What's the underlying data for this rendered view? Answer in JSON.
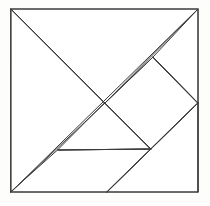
{
  "figure": {
    "shape": "square",
    "piece_count": 7,
    "stroke_color": "#3a3a3a",
    "fill_color": "#ffffff",
    "background_color": "#fdfdfc",
    "canvas": {
      "width": 210,
      "height": 206
    }
  },
  "square_bounds": {
    "left": 11,
    "top": 9,
    "right": 198,
    "bottom": 192,
    "width": 187,
    "height": 183
  },
  "vertices": {
    "top_left": {
      "x": 11,
      "y": 9
    },
    "top_right": {
      "x": 198,
      "y": 9
    },
    "bottom_right": {
      "x": 198,
      "y": 192
    },
    "bottom_left": {
      "x": 11,
      "y": 192
    },
    "center": {
      "x": 105,
      "y": 103
    },
    "right_mid": {
      "x": 198,
      "y": 103
    },
    "bottom_mid": {
      "x": 107,
      "y": 192
    },
    "diamond_top": {
      "x": 153,
      "y": 57
    },
    "diamond_bottom": {
      "x": 151,
      "y": 149
    },
    "para_left": {
      "x": 58,
      "y": 150
    }
  },
  "outer_frame": {
    "name": "square-border",
    "points": "11,9 198,9 198,192 11,192"
  },
  "pieces": [
    {
      "id": "large-triangle-upper-left",
      "label": "Large triangle (upper left)",
      "type": "large-triangle",
      "points": "11,9 198,9 105,103"
    },
    {
      "id": "large-triangle-lower-left",
      "label": "Large triangle (lower left)",
      "type": "large-triangle",
      "points": "11,9 105,103 11,192"
    },
    {
      "id": "medium-triangle-right",
      "label": "Medium triangle (right)",
      "type": "medium-triangle",
      "points": "198,103 198,192 107,192"
    },
    {
      "id": "small-triangle-top-right",
      "label": "Small triangle (top right)",
      "type": "small-triangle",
      "points": "153,57 198,9 198,103"
    },
    {
      "id": "small-triangle-center-bottom",
      "label": "Small triangle (center bottom)",
      "type": "small-triangle",
      "points": "105,103 151,149 58,150"
    },
    {
      "id": "square-center",
      "label": "Square (rotated 45 degrees)",
      "type": "square",
      "points": "105,103 153,57 198,103 151,149"
    },
    {
      "id": "parallelogram-bottom-left",
      "label": "Parallelogram (bottom left)",
      "type": "parallelogram",
      "points": "58,150 151,149 107,192 11,192"
    }
  ],
  "cut_lines": [
    {
      "id": "cut-main-diagonal-tl-br",
      "label": "Diagonal: top-left to center",
      "x1": 11,
      "y1": 9,
      "x2": 105,
      "y2": 103
    },
    {
      "id": "cut-anti-diagonal",
      "label": "Diagonal: bottom-left to top-right",
      "x1": 11,
      "y1": 192,
      "x2": 198,
      "y2": 9
    },
    {
      "id": "cut-center-to-diamond-top",
      "label": "Diamond edge: center to top vertex",
      "x1": 105,
      "y1": 103,
      "x2": 153,
      "y2": 57
    },
    {
      "id": "cut-diamond-top-right",
      "label": "Diamond edge: top vertex to right",
      "x1": 153,
      "y1": 57,
      "x2": 198,
      "y2": 103
    },
    {
      "id": "cut-diamond-right-bottom",
      "label": "Diamond edge: right to bottom vertex",
      "x1": 198,
      "y1": 103,
      "x2": 151,
      "y2": 149
    },
    {
      "id": "cut-diamond-bottom-center",
      "label": "Diamond edge: bottom vertex to center",
      "x1": 151,
      "y1": 149,
      "x2": 105,
      "y2": 103
    },
    {
      "id": "cut-horizontal-parallelogram",
      "label": "Horizontal cut of parallelogram",
      "x1": 58,
      "y1": 150,
      "x2": 151,
      "y2": 149
    },
    {
      "id": "cut-bottom-mid-to-diamond",
      "label": "Cut: bottom edge to diamond bottom",
      "x1": 107,
      "y1": 192,
      "x2": 151,
      "y2": 149
    },
    {
      "id": "cut-right-mid-to-bottom",
      "label": "Cut: right midpoint to bottom-right",
      "x1": 198,
      "y1": 103,
      "x2": 198,
      "y2": 192
    }
  ]
}
